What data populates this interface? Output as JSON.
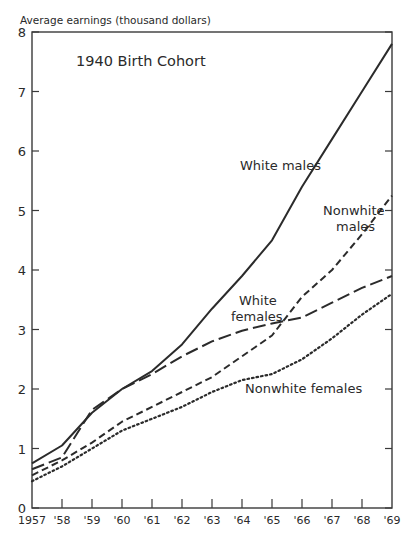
{
  "chart_data": {
    "type": "line",
    "title": "1940 Birth Cohort",
    "xlabel": "",
    "ylabel": "Average earnings (thousand dollars)",
    "ylim": [
      0,
      8
    ],
    "yticks": [
      0,
      1,
      2,
      3,
      4,
      5,
      6,
      7,
      8
    ],
    "grid": false,
    "x": [
      1957,
      1958,
      1959,
      1960,
      1961,
      1962,
      1963,
      1964,
      1965,
      1966,
      1967,
      1968,
      1969
    ],
    "xtick_labels": [
      "1957",
      "'58",
      "'59",
      "'60",
      "'61",
      "'62",
      "'63",
      "'64",
      "'65",
      "'66",
      "'67",
      "'68",
      "'69"
    ],
    "series": [
      {
        "name": "White males",
        "style": "solid",
        "values": [
          0.75,
          1.05,
          1.6,
          2.0,
          2.3,
          2.75,
          3.35,
          3.9,
          4.5,
          5.4,
          6.2,
          7.0,
          7.8
        ]
      },
      {
        "name": "Nonwhite males",
        "style": "short-dash",
        "values": [
          0.55,
          0.8,
          1.1,
          1.45,
          1.7,
          1.95,
          2.2,
          2.55,
          2.9,
          3.55,
          4.0,
          4.6,
          5.25
        ]
      },
      {
        "name": "White females",
        "style": "long-dash",
        "values": [
          0.65,
          0.85,
          1.65,
          2.0,
          2.25,
          2.55,
          2.8,
          2.98,
          3.1,
          3.2,
          3.45,
          3.7,
          3.9
        ]
      },
      {
        "name": "Nonwhite females",
        "style": "dotted",
        "values": [
          0.45,
          0.7,
          1.0,
          1.3,
          1.5,
          1.7,
          1.95,
          2.15,
          2.25,
          2.5,
          2.85,
          3.25,
          3.6
        ]
      }
    ],
    "annotations": [
      {
        "text": "White males",
        "series": "White males"
      },
      {
        "text": "Nonwhite\nmales",
        "series": "Nonwhite males"
      },
      {
        "text": "White\nfemales",
        "series": "White females"
      },
      {
        "text": "Nonwhite females",
        "series": "Nonwhite females"
      }
    ],
    "legend": "inline labels"
  }
}
